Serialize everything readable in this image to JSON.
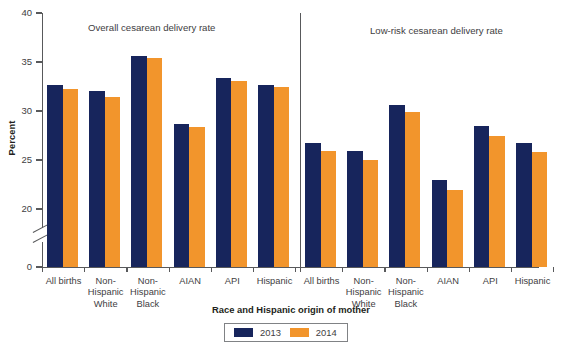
{
  "figure": {
    "y_axis_title": "Percent",
    "x_axis_title": "Race and Hispanic origin of mother",
    "panel_left_title": "Overall cesarean delivery rate",
    "panel_right_title": "Low-risk cesarean delivery rate",
    "y_ticks": [
      "40",
      "35",
      "30",
      "25",
      "20",
      "0"
    ],
    "legend": [
      {
        "label": "2013",
        "color": "#17255c"
      },
      {
        "label": "2014",
        "color": "#f2952c"
      }
    ]
  },
  "chart_data": {
    "type": "bar",
    "title": "",
    "xlabel": "Race and Hispanic origin of mother",
    "ylabel": "Percent",
    "ylim": [
      0,
      40
    ],
    "y_ticks": [
      0,
      20,
      25,
      30,
      35,
      40
    ],
    "axis_break": "between 0 and 20",
    "grid": false,
    "legend_position": "bottom-center",
    "panels": [
      {
        "title": "Overall cesarean delivery rate",
        "categories": [
          "All births",
          "Non-\nHispanic\nWhite",
          "Non-\nHispanic\nBlack",
          "AIAN",
          "API",
          "Hispanic"
        ],
        "series": [
          {
            "name": "2013",
            "color": "#17255c",
            "values": [
              32.7,
              32.0,
              35.6,
              28.7,
              33.4,
              32.7
            ]
          },
          {
            "name": "2014",
            "color": "#f2952c",
            "values": [
              32.2,
              31.4,
              35.4,
              28.4,
              33.1,
              32.5
            ]
          }
        ]
      },
      {
        "title": "Low-risk cesarean delivery rate",
        "categories": [
          "All births",
          "Non-\nHispanic\nWhite",
          "Non-\nHispanic\nBlack",
          "AIAN",
          "API",
          "Hispanic"
        ],
        "series": [
          {
            "name": "2013",
            "color": "#17255c",
            "values": [
              26.7,
              25.9,
              30.6,
              23.0,
              28.5,
              26.7
            ]
          },
          {
            "name": "2014",
            "color": "#f2952c",
            "values": [
              25.9,
              25.0,
              29.9,
              21.9,
              27.5,
              25.8
            ]
          }
        ]
      }
    ]
  }
}
